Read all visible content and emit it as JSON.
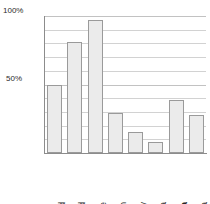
{
  "chart_data": {
    "type": "bar",
    "title": "",
    "xlabel": "",
    "ylabel": "",
    "categories": [
      "England",
      "Holland",
      "France",
      "Spain",
      "Italy",
      "Sardinia",
      "Malta",
      "Tunisia"
    ],
    "values": [
      50,
      81,
      97,
      29,
      15,
      8,
      39,
      28
    ],
    "ylim": [
      0,
      100
    ],
    "y_tick_labels": [
      "50%",
      "100%"
    ],
    "y_tick_values": [
      50,
      100
    ],
    "gridline_values": [
      10,
      20,
      30,
      40,
      50,
      60,
      70,
      80,
      90,
      100
    ],
    "grid": true,
    "legend": "none",
    "bar_fill_color": "#ebebeb",
    "bar_border_color": "#9a9a9a",
    "gridline_color": "#d2d2d2",
    "axis_color": "#8c8c8c",
    "emphasized_categories": [
      "Malta"
    ]
  },
  "axis": {
    "top_label": "100%",
    "mid_label": "50%"
  }
}
